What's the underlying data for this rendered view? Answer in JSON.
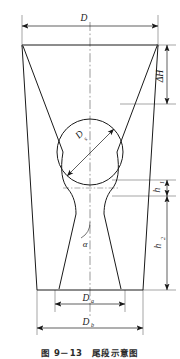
{
  "figure": {
    "caption": "图 9－13　尾段示意图",
    "caption_number": "9－13",
    "caption_title": "尾段示意图",
    "type": "engineering-cross-section-diagram",
    "line_color": "#1a1a1a",
    "background_color": "#ffffff"
  },
  "labels": {
    "top_width": {
      "symbol": "D",
      "subscript": ""
    },
    "delta_height": {
      "symbol": "ΔH",
      "subscript": ""
    },
    "circle_diameter": {
      "symbol": "D",
      "subscript": "s"
    },
    "neck_height": {
      "symbol": "h",
      "subscript": "1"
    },
    "lower_height": {
      "symbol": "h",
      "subscript": "2"
    },
    "angle": {
      "symbol": "α",
      "subscript": ""
    },
    "bottom_inner_width": {
      "symbol": "D",
      "subscript": "a"
    },
    "bottom_outer_width": {
      "symbol": "D",
      "subscript": "b"
    }
  },
  "dimensions": [
    {
      "name": "D",
      "orientation": "horizontal",
      "position": "top",
      "label": "D"
    },
    {
      "name": "dH",
      "orientation": "vertical",
      "position": "right-upper",
      "label": "ΔH"
    },
    {
      "name": "Ds",
      "orientation": "diagonal",
      "position": "center-circle",
      "label": "Ds"
    },
    {
      "name": "h1",
      "orientation": "vertical",
      "position": "right-middle",
      "label": "h1"
    },
    {
      "name": "h2",
      "orientation": "vertical",
      "position": "right-lower",
      "label": "h2"
    },
    {
      "name": "Da",
      "orientation": "horizontal",
      "position": "bottom-inner",
      "label": "Da"
    },
    {
      "name": "Db",
      "orientation": "horizontal",
      "position": "bottom-outer",
      "label": "Db"
    }
  ],
  "geometry": {
    "outer_top_left_x": 22,
    "outer_top_right_x": 158,
    "outer_top_y": 45,
    "outer_bottom_left_x": 37,
    "outer_bottom_right_x": 143,
    "outer_bottom_y": 290,
    "circle_center_x": 90,
    "circle_center_y": 152,
    "circle_radius": 33,
    "centerline_x": 90
  }
}
